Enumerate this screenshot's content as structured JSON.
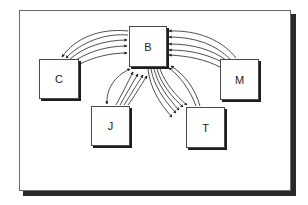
{
  "diagram": {
    "type": "communication-network",
    "nodes": [
      {
        "id": "B",
        "label": "B",
        "x": 129,
        "y": 26,
        "w": 38,
        "h": 41
      },
      {
        "id": "C",
        "label": "C",
        "x": 39,
        "y": 59,
        "w": 40,
        "h": 40
      },
      {
        "id": "M",
        "label": "M",
        "x": 220,
        "y": 59,
        "w": 39,
        "h": 41
      },
      {
        "id": "J",
        "label": "J",
        "x": 91,
        "y": 106,
        "w": 39,
        "h": 40
      },
      {
        "id": "T",
        "label": "T",
        "x": 186,
        "y": 107,
        "w": 39,
        "h": 41
      }
    ],
    "edges": [
      {
        "from": "B",
        "to": "C",
        "count": 2
      },
      {
        "from": "C",
        "to": "B",
        "count": 3
      },
      {
        "from": "M",
        "to": "B",
        "count": 5
      },
      {
        "from": "B",
        "to": "J",
        "count": 1
      },
      {
        "from": "J",
        "to": "B",
        "count": 4
      },
      {
        "from": "B",
        "to": "T",
        "count": 5
      },
      {
        "from": "T",
        "to": "B",
        "count": 2
      }
    ],
    "colors": {
      "line": "#222222",
      "box_border": "#4a4a4a",
      "shadow": "#1e1e1e",
      "background": "#ffffff"
    }
  }
}
